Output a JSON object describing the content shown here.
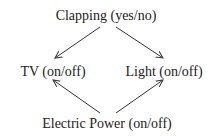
{
  "diagram": {
    "nodes": [
      {
        "id": "clapping",
        "label": "Clapping (yes/no)"
      },
      {
        "id": "tv",
        "label": "TV (on/off)"
      },
      {
        "id": "light",
        "label": "Light (on/off)"
      },
      {
        "id": "power",
        "label": "Electric Power (on/off)"
      }
    ],
    "edges": [
      {
        "from": "clapping",
        "to": "tv"
      },
      {
        "from": "clapping",
        "to": "light"
      },
      {
        "from": "power",
        "to": "tv"
      },
      {
        "from": "power",
        "to": "light"
      }
    ],
    "colors": {
      "stroke": "#333333",
      "text": "#222222",
      "background": "#ffffff"
    }
  }
}
